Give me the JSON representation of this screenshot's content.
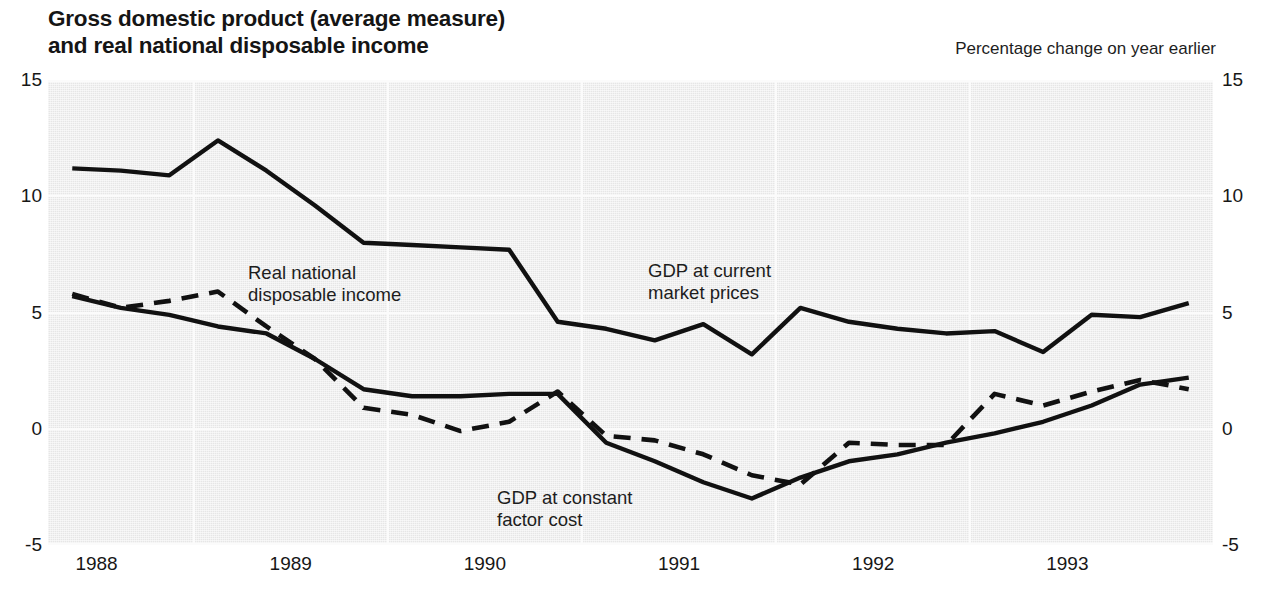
{
  "header": {
    "title": "Gross domestic product (average measure)\nand real national disposable income",
    "subtitle": "Percentage change on year earlier"
  },
  "annotations": [
    {
      "id": "rndi-label",
      "text": "Real national\ndisposable income",
      "x": 248,
      "y": 262
    },
    {
      "id": "gdp-cmp-label",
      "text": "GDP at current\nmarket prices",
      "x": 648,
      "y": 260
    },
    {
      "id": "gdp-cfc-label",
      "text": "GDP at constant\nfactor cost",
      "x": 497,
      "y": 487
    }
  ],
  "chart_data": {
    "type": "line",
    "title": "Gross domestic product (average measure) and real national disposable income",
    "subtitle": "Percentage change on year earlier",
    "xlabel": "",
    "ylabel": "Percentage change on year earlier",
    "ylim": [
      -5,
      15
    ],
    "yticks": [
      -5,
      0,
      5,
      10,
      15
    ],
    "ytick_labels": [
      "-5",
      "0",
      "5",
      "10",
      "15"
    ],
    "xlim": [
      1987.75,
      1993.75
    ],
    "xticks": [
      1988,
      1989,
      1990,
      1991,
      1992,
      1993
    ],
    "xtick_labels": [
      "1988",
      "1989",
      "1990",
      "1991",
      "1992",
      "1993"
    ],
    "gridlines": {
      "vertical_at": [
        1988.5,
        1989.5,
        1990.5,
        1991.5,
        1992.5
      ],
      "horizontal_at": [
        -5,
        0,
        5,
        10,
        15
      ]
    },
    "grid": true,
    "legend_position": "inline-annotations",
    "x": [
      1987.875,
      1988.125,
      1988.375,
      1988.625,
      1988.875,
      1989.125,
      1989.375,
      1989.625,
      1989.875,
      1990.125,
      1990.375,
      1990.625,
      1990.875,
      1991.125,
      1991.375,
      1991.625,
      1991.875,
      1992.125,
      1992.375,
      1992.625,
      1992.875,
      1993.125,
      1993.375,
      1993.625
    ],
    "series": [
      {
        "name": "GDP at current market prices",
        "style": "solid",
        "color": "#111111",
        "values": [
          11.2,
          11.1,
          10.9,
          12.4,
          11.1,
          9.6,
          8.0,
          7.9,
          7.8,
          7.7,
          4.6,
          4.3,
          3.8,
          4.5,
          3.2,
          5.2,
          4.6,
          4.3,
          4.1,
          4.2,
          3.3,
          4.9,
          4.8,
          5.4
        ]
      },
      {
        "name": "GDP at constant factor cost",
        "style": "solid",
        "color": "#111111",
        "values": [
          5.7,
          5.2,
          4.9,
          4.4,
          4.1,
          3.0,
          1.7,
          1.4,
          1.4,
          1.5,
          1.5,
          -0.6,
          -1.4,
          -2.3,
          -3.0,
          -2.1,
          -1.4,
          -1.1,
          -0.6,
          -0.2,
          0.3,
          1.0,
          1.9,
          2.2
        ]
      },
      {
        "name": "Real national disposable income",
        "style": "dashed",
        "color": "#111111",
        "values": [
          5.8,
          5.2,
          5.5,
          5.9,
          4.4,
          3.0,
          0.9,
          0.6,
          -0.1,
          0.3,
          1.6,
          -0.3,
          -0.5,
          -1.1,
          -2.0,
          -2.4,
          -0.6,
          -0.7,
          -0.7,
          1.5,
          1.0,
          1.6,
          2.1,
          1.7
        ]
      }
    ]
  }
}
